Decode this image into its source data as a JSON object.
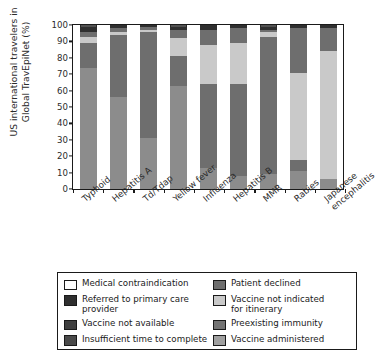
{
  "chart_data": {
    "type": "bar",
    "stacked": true,
    "stack_mode": "percent",
    "title": "",
    "xlabel": "",
    "ylabel": "US international travelers in Global TravEpiNet (%)",
    "ylim": [
      0,
      100
    ],
    "yticks": [
      0,
      10,
      20,
      30,
      40,
      50,
      60,
      70,
      80,
      90,
      100
    ],
    "grid": false,
    "legend_position": "below-plot",
    "categories": [
      "Typhoid",
      "Hepatitis A",
      "Td/Tdap",
      "Yellow fever",
      "Influenza",
      "Hepatitis B",
      "MMR",
      "Rabies",
      "Japanese\nencephalitis"
    ],
    "series": [
      {
        "name": "Vaccine administered",
        "color": "#8c8c8c",
        "values": [
          74,
          56,
          31,
          63,
          13,
          8,
          9,
          11,
          6
        ]
      },
      {
        "name": "Preexisting immunity",
        "color": "#6e6e6e",
        "values": [
          0,
          0,
          0,
          0,
          0,
          0,
          0,
          7,
          0
        ]
      },
      {
        "name": "Vaccine not indicated for itinerary",
        "color": "#c9c9c9",
        "values": [
          0,
          0,
          0,
          0,
          0,
          0,
          0,
          53,
          78
        ]
      },
      {
        "name": "Patient declined",
        "color": "#6e6e6e",
        "values": [
          15,
          38,
          65,
          18,
          51,
          56,
          84,
          0,
          0
        ]
      },
      {
        "name": "Insufficient time to complete",
        "color": "#c9c9c9",
        "values": [
          4,
          2,
          1,
          11,
          24,
          25,
          3,
          0,
          0
        ]
      },
      {
        "name": "Vaccine not available",
        "color": "#6e6e6e",
        "values": [
          3,
          2,
          2,
          5,
          9,
          9,
          1,
          27,
          14
        ]
      },
      {
        "name": "Referred to primary care provider",
        "color": "#2f2f2f",
        "values": [
          3,
          2,
          1,
          2,
          3,
          2,
          2,
          2,
          2
        ]
      },
      {
        "name": "Medical contraindication",
        "color": "#ffffff",
        "values": [
          1,
          0,
          0,
          1,
          0,
          0,
          1,
          0,
          0
        ]
      }
    ]
  },
  "legend": {
    "left_items": [
      {
        "label": "Medical contraindication",
        "color": "#ffffff"
      },
      {
        "label": "Referred to primary care\nprovider",
        "color": "#2f2f2f"
      },
      {
        "label": "Vaccine not available",
        "color": "#3f3f3f"
      },
      {
        "label": "Insufficient time to complete",
        "color": "#4a4a4a"
      }
    ],
    "right_items": [
      {
        "label": "Patient declined",
        "color": "#6e6e6e"
      },
      {
        "label": "Vaccine not indicated\nfor itinerary",
        "color": "#c9c9c9"
      },
      {
        "label": "Preexisting immunity",
        "color": "#737373"
      },
      {
        "label": "Vaccine administered",
        "color": "#a0a0a0"
      }
    ]
  },
  "axis": {
    "y_title": "US international travelers in\nGlobal TravEpiNet (%)"
  }
}
